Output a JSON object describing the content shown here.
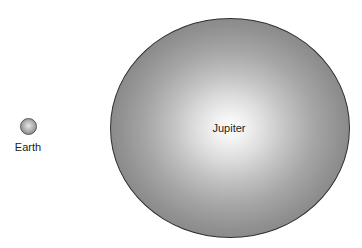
{
  "diagram": {
    "type": "planet-size-comparison",
    "planets": [
      {
        "name": "Earth",
        "label": "Earth",
        "relative_size": "small",
        "color": "#9a9a9a"
      },
      {
        "name": "Jupiter",
        "label": "Jupiter",
        "relative_size": "large",
        "color": "#a6a6a6"
      }
    ]
  },
  "colors": {
    "background": "#ffffff",
    "outline": "#2f2f2f",
    "label_text": "#222222"
  }
}
